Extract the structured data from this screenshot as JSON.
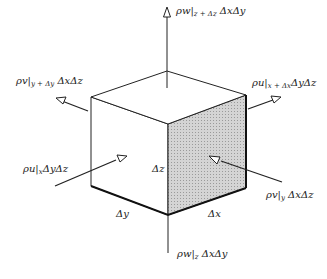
{
  "diagram": {
    "colors": {
      "line": "#222222",
      "shaded_face": "#c8c8c8",
      "background": "#ffffff"
    },
    "fluxes": {
      "top": {
        "main": "ρw",
        "sub": "z + Δz",
        "tail": "ΔxΔy"
      },
      "bottom": {
        "main": "ρw",
        "sub": "z",
        "tail": "ΔxΔy"
      },
      "left_back": {
        "main": "ρv",
        "sub": "y + Δy",
        "tail": "ΔxΔz"
      },
      "right_back": {
        "main": "ρu",
        "sub": "x + Δx",
        "tail": "ΔyΔz"
      },
      "left_front": {
        "main": "ρu",
        "sub": "x",
        "tail": "ΔyΔz"
      },
      "right_front": {
        "main": "ρv",
        "sub": "y",
        "tail": "ΔxΔz"
      }
    },
    "dimensions": {
      "dz": "Δz",
      "dy": "Δy",
      "dx": "Δx"
    }
  }
}
